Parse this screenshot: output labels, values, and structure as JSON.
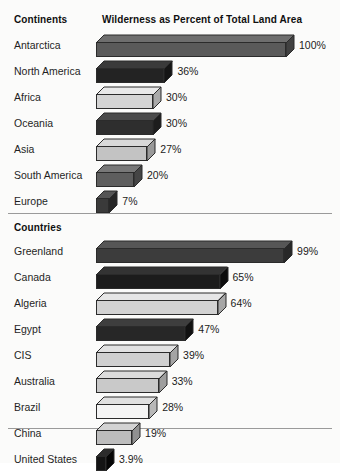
{
  "headers": {
    "continents": "Continents",
    "countries": "Countries",
    "title": "Wilderness as Percent of Total Land Area"
  },
  "colors": {
    "background": "#fbfbfa",
    "outline": "#2b2b2b",
    "rule": "#9a9a9a",
    "text": "#1b1b1b"
  },
  "chart_data": {
    "type": "bar",
    "title": "Wilderness as Percent of Total Land Area",
    "xlabel": "",
    "ylabel": "",
    "xlim": [
      0,
      100
    ],
    "grid": false,
    "legend": "none",
    "orientation": "horizontal",
    "style": "3d-isometric-bars",
    "sections": [
      {
        "name": "Continents",
        "categories": [
          "Antarctica",
          "North America",
          "Africa",
          "Oceania",
          "Asia",
          "South America",
          "Europe"
        ],
        "values": [
          100,
          36,
          30,
          30,
          27,
          20,
          7
        ],
        "value_labels": [
          "100%",
          "36%",
          "30%",
          "30%",
          "27%",
          "20%",
          "7%"
        ],
        "bar_fills": [
          "#5a5a5a",
          "#232323",
          "#d4d4d4",
          "#2e2e2e",
          "#c3c3c3",
          "#5e5e5e",
          "#3a3a3a"
        ],
        "bar_tops": [
          "#6e6e6e",
          "#3a3a3a",
          "#e8e8e8",
          "#4a4a4a",
          "#d8d8d8",
          "#787878",
          "#555555"
        ],
        "bar_sides": [
          "#414141",
          "#151515",
          "#a9a9a9",
          "#1d1d1d",
          "#9a9a9a",
          "#454545",
          "#262626"
        ]
      },
      {
        "name": "Countries",
        "categories": [
          "Greenland",
          "Canada",
          "Algeria",
          "Egypt",
          "CIS",
          "Australia",
          "Brazil",
          "China",
          "United States"
        ],
        "values": [
          99,
          65,
          64,
          47,
          39,
          33,
          28,
          19,
          3.9
        ],
        "value_labels": [
          "99%",
          "65%",
          "64%",
          "47%",
          "39%",
          "33%",
          "28%",
          "19%",
          "3.9%"
        ],
        "bar_fills": [
          "#3c3c3c",
          "#1c1c1c",
          "#d2d2d2",
          "#272727",
          "#d0d0d0",
          "#c9c9c9",
          "#f4f4f4",
          "#bdbdbd",
          "#141414"
        ],
        "bar_tops": [
          "#565656",
          "#333333",
          "#e6e6e6",
          "#3e3e3e",
          "#e2e2e2",
          "#dcdcdc",
          "#e0e0e0",
          "#d3d3d3",
          "#2c2c2c"
        ],
        "bar_sides": [
          "#282828",
          "#0d0d0d",
          "#a6a6a6",
          "#111111",
          "#a4a4a4",
          "#9e9e9e",
          "#b8b8b8",
          "#919191",
          "#060606"
        ]
      }
    ]
  }
}
